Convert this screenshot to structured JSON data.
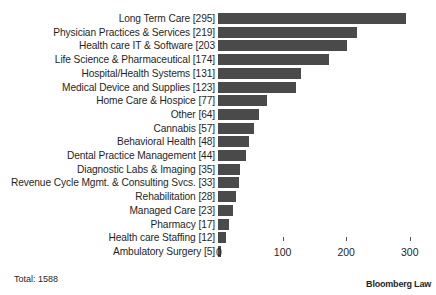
{
  "chart_data": {
    "type": "bar",
    "orientation": "horizontal",
    "title": "",
    "xlabel": "",
    "ylabel": "",
    "categories": [
      "Long Term Care",
      "Physician Practices & Services",
      "Health care IT & Software",
      "Life Science & Pharmaceutical",
      "Hospital/Health Systems",
      "Medical Device and Supplies",
      "Home Care & Hospice",
      "Other",
      "Cannabis",
      "Behavioral Health",
      "Dental Practice Management",
      "Diagnostic Labs & Imaging",
      "Revenue Cycle Mgmt. & Consulting Svcs.",
      "Rehabilitation",
      "Managed Care",
      "Pharmacy",
      "Health care Staffing",
      "Ambulatory Surgery"
    ],
    "values": [
      295,
      219,
      203,
      174,
      131,
      123,
      77,
      64,
      57,
      48,
      44,
      35,
      33,
      28,
      23,
      17,
      12,
      5
    ],
    "category_labels": [
      "Long Term Care [295]",
      "Physician Practices & Services [219]",
      "Health care IT & Software [203",
      "Life Science & Pharmaceutical [174]",
      "Hospital/Health Systems [131]",
      "Medical Device and Supplies [123]",
      "Home Care & Hospice [77]",
      "Other [64]",
      "Cannabis [57]",
      "Behavioral Health [48]",
      "Dental Practice Management [44]",
      "Diagnostic Labs & Imaging [35]",
      "Revenue Cycle Mgmt. & Consulting Svcs. [33]",
      "Rehabilitation [28]",
      "Managed Care [23]",
      "Pharmacy [17]",
      "Health care Staffing [12]",
      "Ambulatory Surgery [5]"
    ],
    "xlim": [
      0,
      300
    ],
    "x_ticks": [
      0,
      100,
      200,
      300
    ],
    "x_tick_labels": [
      "0",
      "100",
      "200",
      "300"
    ],
    "grid": false,
    "legend": null,
    "bar_color": "#4a4a4a",
    "annotations": [
      "Total: 1588",
      "Bloomberg Law"
    ]
  },
  "footer": {
    "total_label": "Total: 1588",
    "source_label": "Bloomberg Law"
  }
}
